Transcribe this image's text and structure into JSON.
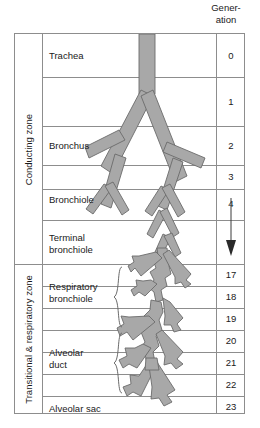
{
  "header": {
    "generation_line1": "Gener-",
    "generation_line2": "ation"
  },
  "zones": [
    {
      "name": "conducting",
      "label": "Conducting zone"
    },
    {
      "name": "transitional-respiratory",
      "label": "Transitional & respiratory zone"
    }
  ],
  "rows": [
    {
      "name": "trachea",
      "label": "Trachea",
      "generation": "0"
    },
    {
      "name": "generation-1",
      "label": "",
      "generation": "1"
    },
    {
      "name": "bronchus",
      "label": "Bronchus",
      "generation": "2"
    },
    {
      "name": "generation-3",
      "label": "",
      "generation": "3"
    },
    {
      "name": "bronchiole",
      "label": "Bronchiole",
      "generation": "4"
    },
    {
      "name": "terminal-bronchiole",
      "label": "Terminal\nbronchiole",
      "generation": "arrow"
    },
    {
      "name": "respiratory-bronchiole-17",
      "label": "Respiratory\nbronchiole",
      "generation": "17"
    },
    {
      "name": "respiratory-bronchiole-18",
      "label": "",
      "generation": "18"
    },
    {
      "name": "respiratory-bronchiole-19",
      "label": "",
      "generation": "19"
    },
    {
      "name": "alveolar-duct-20",
      "label": "Alveolar\nduct",
      "generation": "20"
    },
    {
      "name": "alveolar-duct-21",
      "label": "",
      "generation": "21"
    },
    {
      "name": "alveolar-duct-22",
      "label": "",
      "generation": "22"
    },
    {
      "name": "alveolar-sac",
      "label": "Alveolar sac",
      "generation": "23"
    }
  ],
  "braces": [
    {
      "name": "respiratory-bronchiole-brace",
      "groups": "17-19"
    },
    {
      "name": "alveolar-duct-brace",
      "groups": "20-22"
    }
  ],
  "colors": {
    "airway_fill": "#a8a8a8",
    "airway_stroke": "#6b6b6b",
    "rule": "#8d8d8d",
    "text": "#1a1a1a",
    "background": "#ffffff"
  }
}
